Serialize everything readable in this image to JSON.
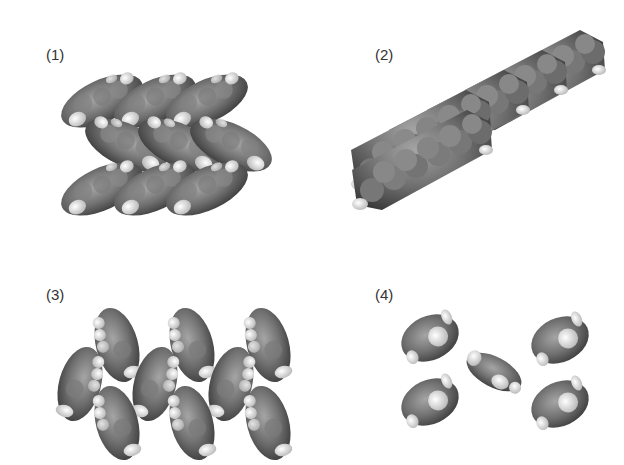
{
  "figure": {
    "panels": [
      {
        "id": 1,
        "label": "(1)",
        "description": "herringbone packing, 3x3 grid of tilted molecules"
      },
      {
        "id": 2,
        "label": "(2)",
        "description": "pi-stacked column of 5 planar molecules"
      },
      {
        "id": 3,
        "label": "(3)",
        "description": "herringbone packing viewed along molecular axis, 11 molecules"
      },
      {
        "id": 4,
        "label": "(4)",
        "description": "four corner molecules with one central rotated molecule"
      }
    ],
    "colors": {
      "carbon": "#6e6e6e",
      "carbon_highlight": "#9a9a9a",
      "carbon_shadow": "#3c3c3c",
      "hydrogen": "#eeeeee",
      "label": "#333333",
      "background": "#ffffff"
    }
  }
}
